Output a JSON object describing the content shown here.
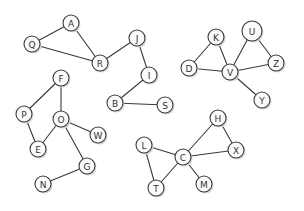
{
  "graph": {
    "nodes": [
      {
        "id": "Q",
        "label": "Q",
        "x": 32,
        "y": 44
      },
      {
        "id": "A",
        "label": "A",
        "x": 71,
        "y": 23
      },
      {
        "id": "R",
        "label": "R",
        "x": 100,
        "y": 63
      },
      {
        "id": "J",
        "label": "J",
        "x": 137,
        "y": 38
      },
      {
        "id": "I",
        "label": "I",
        "x": 149,
        "y": 75
      },
      {
        "id": "B",
        "label": "B",
        "x": 115,
        "y": 103
      },
      {
        "id": "S",
        "label": "S",
        "x": 165,
        "y": 105
      },
      {
        "id": "K",
        "label": "K",
        "x": 216,
        "y": 37
      },
      {
        "id": "D",
        "label": "D",
        "x": 189,
        "y": 68
      },
      {
        "id": "V",
        "label": "V",
        "x": 230,
        "y": 72
      },
      {
        "id": "U",
        "label": "U",
        "x": 252,
        "y": 31,
        "r": 10
      },
      {
        "id": "Z",
        "label": "Z",
        "x": 276,
        "y": 63
      },
      {
        "id": "Y",
        "label": "Y",
        "x": 262,
        "y": 100
      },
      {
        "id": "F",
        "label": "F",
        "x": 61,
        "y": 78
      },
      {
        "id": "P",
        "label": "P",
        "x": 24,
        "y": 114
      },
      {
        "id": "O",
        "label": "O",
        "x": 61,
        "y": 119
      },
      {
        "id": "W",
        "label": "W",
        "x": 98,
        "y": 135
      },
      {
        "id": "E",
        "label": "E",
        "x": 38,
        "y": 149
      },
      {
        "id": "G",
        "label": "G",
        "x": 87,
        "y": 166
      },
      {
        "id": "N",
        "label": "N",
        "x": 43,
        "y": 184
      },
      {
        "id": "L",
        "label": "L",
        "x": 144,
        "y": 145
      },
      {
        "id": "C",
        "label": "C",
        "x": 183,
        "y": 157
      },
      {
        "id": "H",
        "label": "H",
        "x": 218,
        "y": 118
      },
      {
        "id": "X",
        "label": "X",
        "x": 236,
        "y": 150
      },
      {
        "id": "T",
        "label": "T",
        "x": 156,
        "y": 188
      },
      {
        "id": "M",
        "label": "M",
        "x": 204,
        "y": 184
      }
    ],
    "edges": [
      [
        "Q",
        "A"
      ],
      [
        "A",
        "R"
      ],
      [
        "Q",
        "R"
      ],
      [
        "R",
        "J"
      ],
      [
        "J",
        "I"
      ],
      [
        "I",
        "B"
      ],
      [
        "B",
        "S"
      ],
      [
        "D",
        "K"
      ],
      [
        "K",
        "V"
      ],
      [
        "D",
        "V"
      ],
      [
        "V",
        "U"
      ],
      [
        "U",
        "Z"
      ],
      [
        "V",
        "Z"
      ],
      [
        "V",
        "Y"
      ],
      [
        "F",
        "P"
      ],
      [
        "F",
        "O"
      ],
      [
        "P",
        "E"
      ],
      [
        "E",
        "O"
      ],
      [
        "O",
        "W"
      ],
      [
        "O",
        "G"
      ],
      [
        "G",
        "N"
      ],
      [
        "L",
        "C"
      ],
      [
        "L",
        "T"
      ],
      [
        "T",
        "C"
      ],
      [
        "C",
        "H"
      ],
      [
        "H",
        "X"
      ],
      [
        "C",
        "X"
      ],
      [
        "C",
        "M"
      ]
    ],
    "style": {
      "node_radius": 8,
      "edge_color": "#3a3a3a",
      "node_fill": "#fbfbfb",
      "shadow_color": "#d8d8d8"
    }
  }
}
